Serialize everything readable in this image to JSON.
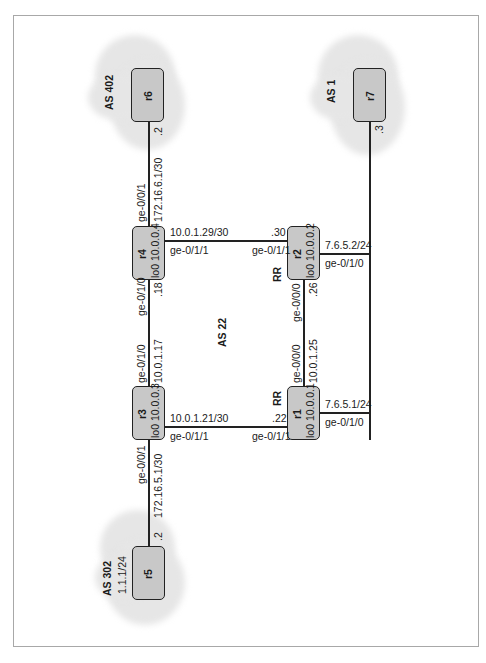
{
  "diagram": {
    "type": "network-topology",
    "as_labels": {
      "as402": "AS 402",
      "as1": "AS 1",
      "as22": "AS 22",
      "as302": "AS 302",
      "as302_subnet": "1.1.1/24"
    },
    "routers": [
      {
        "id": "r1",
        "name": "r1",
        "loopback": "lo0 10.0.0.1",
        "role": "RR"
      },
      {
        "id": "r2",
        "name": "r2",
        "loopback": "lo0 10.0.0.2",
        "role": "RR"
      },
      {
        "id": "r3",
        "name": "r3",
        "loopback": "lo0 10.0.0.3"
      },
      {
        "id": "r4",
        "name": "r4",
        "loopback": "lo0 10.0.0.4"
      },
      {
        "id": "r5",
        "name": "r5"
      },
      {
        "id": "r6",
        "name": "r6"
      },
      {
        "id": "r7",
        "name": "r7"
      }
    ],
    "links": {
      "r4_r6": {
        "r4_if": "ge-0/0/1",
        "subnet": "172.16.6.1/30",
        "r6_host": ".2"
      },
      "r4_r2": {
        "subnet": "10.0.1.29/30",
        "r4_if": "ge-0/1/1",
        "r2_host": ".30",
        "r2_if": "ge-0/1/1"
      },
      "r4_r3": {
        "r4_if": "ge-0/1/0",
        "r4_host": ".18",
        "r3_if": "ge-0/1/0",
        "subnet": "10.0.1.17"
      },
      "r2_r1": {
        "r2_if": "ge-0/0/0",
        "r2_host": ".26",
        "r1_if": "ge-0/0/0",
        "subnet": "10.0.1.25"
      },
      "r3_r1": {
        "subnet": "10.0.1.21/30",
        "r3_if": "ge-0/1/1",
        "r1_host": ".22",
        "r1_if": "ge-0/1/1"
      },
      "r3_r5": {
        "r3_if": "ge-0/0/1",
        "subnet": "172.16.5.1/30",
        "r5_host": ".2"
      },
      "r2_lan": {
        "addr": "7.6.5.2/24",
        "if": "ge-0/1/0"
      },
      "r1_lan": {
        "addr": "7.6.5.1/24",
        "if": "ge-0/1/0"
      },
      "r7_lan": {
        "host": ".3"
      }
    }
  }
}
